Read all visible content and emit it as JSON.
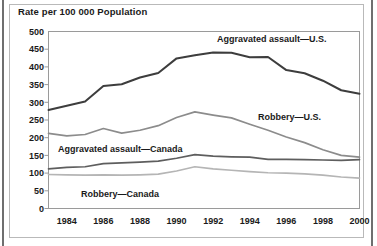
{
  "figure": {
    "title": "Rate per 100 000 Population"
  },
  "chart_data": {
    "type": "line",
    "title": "Rate per 100 000 Population",
    "xlabel": "",
    "ylabel": "Rate per 100 000 Population",
    "xlim": [
      1983,
      2000
    ],
    "ylim": [
      0,
      500
    ],
    "ytick_step": 50,
    "yticks": [
      0,
      50,
      100,
      150,
      200,
      250,
      300,
      350,
      400,
      450,
      500
    ],
    "ytick_labels": [
      "0",
      "50",
      "100",
      "150",
      "200",
      "250",
      "300",
      "350",
      "400",
      "450",
      "500"
    ],
    "xticks": [
      1984,
      1986,
      1988,
      1990,
      1992,
      1994,
      1996,
      1998,
      2000
    ],
    "xtick_labels": [
      "1984",
      "1986",
      "1988",
      "1990",
      "1992",
      "1994",
      "1996",
      "1998",
      "2000"
    ],
    "grid": false,
    "legend_position": "inline-annotations",
    "x": [
      1983,
      1984,
      1985,
      1986,
      1987,
      1988,
      1989,
      1990,
      1991,
      1992,
      1993,
      1994,
      1995,
      1996,
      1997,
      1998,
      1999,
      2000
    ],
    "series": [
      {
        "name": "Aggravated assault—U.S.",
        "color": "#3d3d3d",
        "width": 2.0,
        "values": [
          278,
          290,
          302,
          346,
          351,
          370,
          383,
          424,
          433,
          441,
          440,
          427,
          428,
          391,
          382,
          361,
          334,
          324
        ]
      },
      {
        "name": "Robbery—U.S.",
        "color": "#8c8c8c",
        "width": 1.7,
        "values": [
          212,
          205,
          209,
          226,
          213,
          221,
          234,
          257,
          273,
          264,
          256,
          238,
          221,
          202,
          186,
          166,
          150,
          145
        ]
      },
      {
        "name": "Aggravated assault—Canada",
        "color": "#5e5e5e",
        "width": 1.7,
        "values": [
          112,
          116,
          118,
          127,
          129,
          131,
          134,
          142,
          152,
          148,
          146,
          145,
          139,
          139,
          138,
          137,
          136,
          138
        ]
      },
      {
        "name": "Robbery—Canada",
        "color": "#b5b5b5",
        "width": 1.7,
        "values": [
          96,
          95,
          94,
          95,
          94,
          95,
          97,
          106,
          118,
          112,
          108,
          104,
          101,
          100,
          98,
          94,
          89,
          86
        ]
      }
    ],
    "annotations": [
      {
        "text": "Aggravated assault—U.S.",
        "x_px": 217,
        "y_px": 42
      },
      {
        "text": "Robbery—U.S.",
        "x_px": 258,
        "y_px": 120
      },
      {
        "text": "Aggravated assault—Canada",
        "x_px": 58,
        "y_px": 152
      },
      {
        "text": "Robbery—Canada",
        "x_px": 81,
        "y_px": 197
      }
    ]
  }
}
